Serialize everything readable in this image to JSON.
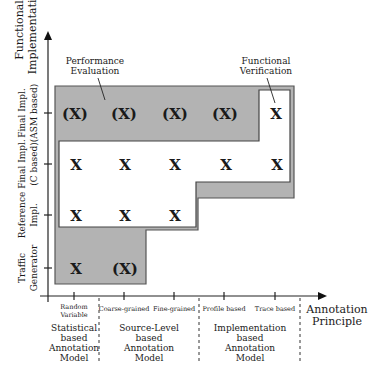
{
  "y_axis": {
    "title_line1": "Functional",
    "title_line2": "Implementation",
    "ticks": [
      {
        "line1": "Final Impl.",
        "line2": "(ASM based)",
        "y": 113
      },
      {
        "line1": "Final Impl.",
        "line2": "(C based)",
        "y": 164
      },
      {
        "line1": "Reference",
        "line2": "Impl.",
        "y": 215
      },
      {
        "line1": "Traffic",
        "line2": "Generator",
        "y": 268
      }
    ]
  },
  "x_axis": {
    "title_line1": "Annotation",
    "title_line2": "Principle",
    "ticks": [
      {
        "line1": "Random",
        "line2": "Variable",
        "x": 74
      },
      {
        "line1": "Coarse-grained",
        "line2": "",
        "x": 124
      },
      {
        "line1": "Fine-grained",
        "line2": "",
        "x": 174
      },
      {
        "line1": "Profile based",
        "line2": "",
        "x": 224
      },
      {
        "line1": "Trace based",
        "line2": "",
        "x": 275
      }
    ]
  },
  "groups": [
    {
      "lines": [
        "Statistical",
        "based",
        "Annotation",
        "Model"
      ],
      "x": 74
    },
    {
      "lines": [
        "Source-Level",
        "based",
        "Annotation",
        "Model"
      ],
      "x": 149
    },
    {
      "lines": [
        "Implementation",
        "based",
        "Annotation",
        "Model"
      ],
      "x": 250
    }
  ],
  "callouts": {
    "performance": {
      "line1": "Performance",
      "line2": "Evaluation"
    },
    "functional": {
      "line1": "Functional",
      "line2": "Verification"
    }
  },
  "cells": {
    "asm": [
      "(X)",
      "(X)",
      "(X)",
      "(X)",
      "X"
    ],
    "c": [
      "X",
      "X",
      "X",
      "X",
      "X"
    ],
    "ref": [
      "X",
      "X",
      "X"
    ],
    "traffic": [
      "X",
      "(X)"
    ]
  },
  "colors": {
    "gray_region": "#b3b3b3",
    "white_region": "#ffffff",
    "line": "#333333"
  }
}
